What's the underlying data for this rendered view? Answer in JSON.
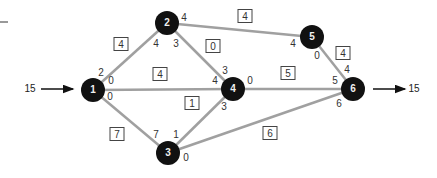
{
  "diagram": {
    "type": "flow-network",
    "colors": {
      "node": "#111111",
      "edge": "#a0a0a0",
      "arrow": "#111111"
    },
    "source_flow": {
      "label": "15"
    },
    "sink_flow": {
      "label": "15"
    },
    "nodes": [
      {
        "id": "1",
        "label": "1",
        "x": 93,
        "y": 90
      },
      {
        "id": "2",
        "label": "2",
        "x": 167,
        "y": 23
      },
      {
        "id": "3",
        "label": "3",
        "x": 168,
        "y": 153
      },
      {
        "id": "4",
        "label": "4",
        "x": 233,
        "y": 89
      },
      {
        "id": "5",
        "label": "5",
        "x": 312,
        "y": 37
      },
      {
        "id": "6",
        "label": "6",
        "x": 353,
        "y": 89
      }
    ],
    "edges": [
      {
        "from": "1",
        "to": "2",
        "capacity": "4",
        "flow_at_from": "2",
        "flow_at_to": "4"
      },
      {
        "from": "1",
        "to": "4",
        "capacity": "4",
        "flow_at_from": "0",
        "flow_at_to": "4"
      },
      {
        "from": "1",
        "to": "3",
        "capacity": "7",
        "flow_at_from": "0",
        "flow_at_to": "7"
      },
      {
        "from": "2",
        "to": "4",
        "capacity": "0",
        "flow_at_from": "3",
        "flow_at_to": "3"
      },
      {
        "from": "2",
        "to": "5",
        "capacity": "4",
        "flow_at_from": "4",
        "flow_at_to": "4"
      },
      {
        "from": "3",
        "to": "4",
        "capacity": "1",
        "flow_at_from": "1",
        "flow_at_to": "3"
      },
      {
        "from": "3",
        "to": "6",
        "capacity": "6",
        "flow_at_from": "0",
        "flow_at_to": "6"
      },
      {
        "from": "4",
        "to": "6",
        "capacity": "5",
        "flow_at_from": "0",
        "flow_at_to": "5"
      },
      {
        "from": "5",
        "to": "6",
        "capacity": "4",
        "flow_at_from": "0",
        "flow_at_to": "4"
      }
    ]
  }
}
